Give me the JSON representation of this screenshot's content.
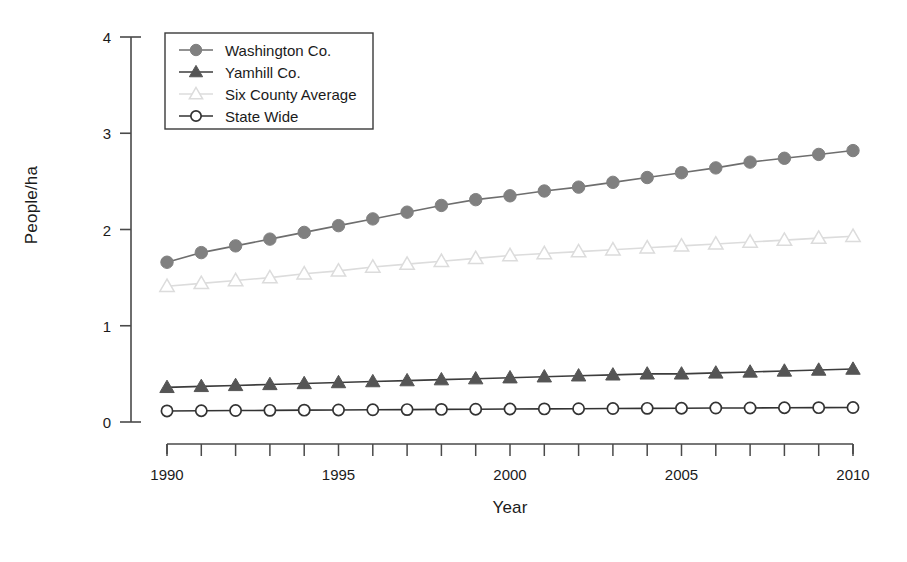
{
  "chart_data": {
    "type": "line",
    "title": "",
    "xlabel": "Year",
    "ylabel": "People/ha",
    "xlim": [
      1990,
      2010
    ],
    "ylim": [
      0,
      4
    ],
    "xticks": [
      1990,
      1991,
      1992,
      1993,
      1994,
      1995,
      1996,
      1997,
      1998,
      1999,
      2000,
      2001,
      2002,
      2003,
      2004,
      2005,
      2006,
      2007,
      2008,
      2009,
      2010
    ],
    "xtick_labels": [
      "1990",
      "",
      "",
      "",
      "",
      "1995",
      "",
      "",
      "",
      "",
      "2000",
      "",
      "",
      "",
      "",
      "2005",
      "",
      "",
      "",
      "",
      "2010"
    ],
    "yticks": [
      0,
      1,
      2,
      3,
      4
    ],
    "ytick_labels": [
      "0",
      "1",
      "2",
      "3",
      "4"
    ],
    "grid": false,
    "legend_position": "upper left",
    "x": [
      1990,
      1991,
      1992,
      1993,
      1994,
      1995,
      1996,
      1997,
      1998,
      1999,
      2000,
      2001,
      2002,
      2003,
      2004,
      2005,
      2006,
      2007,
      2008,
      2009,
      2010
    ],
    "series": [
      {
        "name": "Washington Co.",
        "marker": "filled-circle",
        "color": "#808080",
        "line_color": "#6e6e6e",
        "values": [
          1.66,
          1.76,
          1.83,
          1.9,
          1.97,
          2.04,
          2.11,
          2.18,
          2.25,
          2.31,
          2.35,
          2.4,
          2.44,
          2.49,
          2.54,
          2.59,
          2.64,
          2.7,
          2.74,
          2.78,
          2.82
        ]
      },
      {
        "name": "Yamhill Co.",
        "marker": "filled-triangle",
        "color": "#555555",
        "line_color": "#3d3d3d",
        "values": [
          0.36,
          0.37,
          0.38,
          0.39,
          0.4,
          0.41,
          0.42,
          0.43,
          0.44,
          0.45,
          0.46,
          0.47,
          0.48,
          0.49,
          0.5,
          0.5,
          0.51,
          0.52,
          0.53,
          0.54,
          0.55
        ]
      },
      {
        "name": "Six County Average",
        "marker": "open-triangle",
        "color": "#d8d8d8",
        "line_color": "#dcdcdc",
        "values": [
          1.41,
          1.44,
          1.47,
          1.5,
          1.54,
          1.57,
          1.61,
          1.64,
          1.67,
          1.7,
          1.73,
          1.75,
          1.77,
          1.79,
          1.81,
          1.83,
          1.85,
          1.87,
          1.89,
          1.91,
          1.93
        ]
      },
      {
        "name": "State Wide",
        "marker": "open-circle",
        "color": "#ffffff",
        "line_color": "#333333",
        "values": [
          0.115,
          0.117,
          0.119,
          0.121,
          0.123,
          0.125,
          0.127,
          0.129,
          0.131,
          0.133,
          0.135,
          0.136,
          0.138,
          0.14,
          0.142,
          0.143,
          0.145,
          0.146,
          0.148,
          0.149,
          0.15
        ]
      }
    ],
    "legend_entries": [
      "Washington Co.",
      "Yamhill Co.",
      "Six County Average",
      "State Wide"
    ]
  },
  "axes": {
    "x_title": "Year",
    "y_title": "People/ha"
  }
}
